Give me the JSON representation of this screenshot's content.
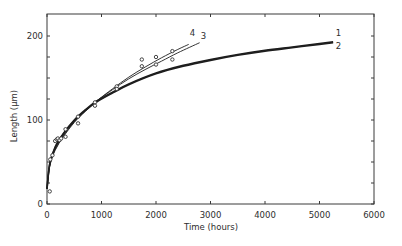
{
  "chart_data": {
    "type": "line",
    "title": "",
    "xlabel": "Time (hours)",
    "ylabel": "Length (µm)",
    "xlim": [
      0,
      6000
    ],
    "ylim": [
      0,
      225
    ],
    "grid": false,
    "legend": "inline curve labels",
    "x_ticks": [
      0,
      1000,
      2000,
      3000,
      4000,
      5000,
      6000
    ],
    "x_tick_labels": [
      "0",
      "1000",
      "2000",
      "3000",
      "4000",
      "5000",
      "6000"
    ],
    "y_ticks_labeled": [
      0,
      100,
      200
    ],
    "y_tick_labels": [
      "0",
      "100",
      "200"
    ],
    "y_minor_ticks": [
      25,
      50,
      75,
      125,
      150,
      175
    ],
    "series": [
      {
        "name": "1",
        "label_pos": [
          5300,
          200
        ],
        "thick": true,
        "x": [
          0,
          50,
          150,
          300,
          500,
          700,
          900,
          1200,
          1500,
          2000,
          2500,
          3000,
          3500,
          4000,
          4500,
          5000,
          5250
        ],
        "y": [
          18,
          48,
          68,
          84,
          100,
          112,
          122,
          133,
          143,
          156,
          165,
          172,
          178,
          183,
          187,
          191,
          193
        ]
      },
      {
        "name": "2",
        "label_pos": [
          5300,
          184
        ],
        "thick": true,
        "x": [
          0,
          50,
          150,
          300,
          500,
          700,
          900,
          1200,
          1500,
          2000,
          2500,
          3000,
          3500,
          4000,
          4500,
          5000,
          5250
        ],
        "y": [
          18,
          47,
          67,
          83,
          99,
          111,
          121,
          132,
          142,
          155,
          164,
          171,
          177,
          182,
          186,
          190,
          192
        ]
      },
      {
        "name": "3",
        "label_pos": [
          2820,
          196
        ],
        "thick": false,
        "x": [
          0,
          50,
          150,
          300,
          500,
          700,
          900,
          1200,
          1500,
          1800,
          2100,
          2400,
          2800
        ],
        "y": [
          18,
          46,
          65,
          81,
          98,
          111,
          122,
          136,
          149,
          160,
          170,
          180,
          192
        ]
      },
      {
        "name": "4",
        "label_pos": [
          2620,
          200
        ],
        "thick": false,
        "x": [
          0,
          50,
          150,
          300,
          500,
          700,
          900,
          1200,
          1500,
          1800,
          2100,
          2400,
          2600
        ],
        "y": [
          18,
          45,
          64,
          80,
          97,
          110,
          122,
          137,
          151,
          163,
          174,
          184,
          190
        ]
      }
    ],
    "points": {
      "name": "measured",
      "x": [
        50,
        60,
        100,
        150,
        180,
        200,
        230,
        260,
        340,
        340,
        570,
        570,
        880,
        880,
        1280,
        1280,
        1740,
        1740,
        2000,
        2000,
        2300,
        2300
      ],
      "y": [
        15,
        53,
        58,
        75,
        77,
        78,
        76,
        78,
        89,
        80,
        104,
        96,
        121,
        117,
        140,
        137,
        172,
        164,
        175,
        166,
        182,
        172
      ]
    }
  }
}
